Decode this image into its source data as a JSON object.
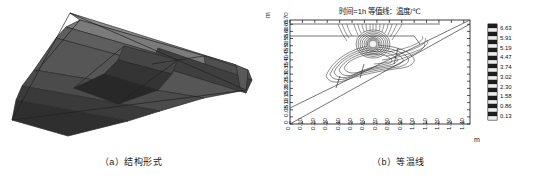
{
  "figure": {
    "panel_a": {
      "caption": "（a）结构形式",
      "name": "structural-form-3d-view"
    },
    "panel_b": {
      "caption": "（b）等温线",
      "name": "isotherm-contour-plot"
    }
  },
  "chart_data": {
    "type": "contour",
    "title": "时间=1h 等值线：温度/℃",
    "xlabel": "m",
    "ylabel": "m",
    "xlim": [
      0,
      1.45
    ],
    "ylim": [
      0,
      0.73
    ],
    "grid": false,
    "legend_position": "right",
    "xticks": [
      "0",
      "0.10",
      "0.20",
      "0.30",
      "0.40",
      "0.50",
      "0.60",
      "0.70",
      "0.80",
      "0.90",
      "1.00",
      "1.10",
      "1.20",
      "1.30",
      "1.40"
    ],
    "xtick_values": [
      0,
      0.1,
      0.2,
      0.3,
      0.4,
      0.5,
      0.6,
      0.7,
      0.8,
      0.9,
      1.0,
      1.1,
      1.2,
      1.3,
      1.4
    ],
    "yticks": [
      "0",
      "0.05",
      "0.10",
      "0.15",
      "0.20",
      "0.25",
      "0.30",
      "0.35",
      "0.40",
      "0.45",
      "0.50",
      "0.55",
      "0.60",
      "0.65",
      "0.70"
    ],
    "ytick_values": [
      0,
      0.05,
      0.1,
      0.15,
      0.2,
      0.25,
      0.3,
      0.35,
      0.4,
      0.45,
      0.5,
      0.55,
      0.6,
      0.65,
      0.7
    ],
    "colorbar": {
      "unit": "℃",
      "labels": [
        "6.63",
        "5.91",
        "5.19",
        "4.47",
        "3.74",
        "3.02",
        "2.30",
        "1.58",
        "0.86",
        "0.13"
      ],
      "values": [
        6.63,
        5.91,
        5.19,
        4.47,
        3.74,
        3.02,
        2.3,
        1.58,
        0.86,
        0.13
      ],
      "min": 0.13,
      "max": 6.63
    },
    "annotations": [
      "热源中心位于 x≈0.78 m, y≈0.55 m",
      "等温线围绕热源呈同心闭合分布",
      "斜向结构界面自左下延伸至右上"
    ]
  },
  "colors": {
    "axis": "#1a1a1a",
    "contour": "#2b2b2b",
    "hotspot": "#f2f2f2",
    "band_light": "#9a9a9a",
    "band_mid": "#6e6e6e",
    "band_dark": "#4a4a4a",
    "band_darker": "#343434",
    "band_darkest": "#262626"
  }
}
